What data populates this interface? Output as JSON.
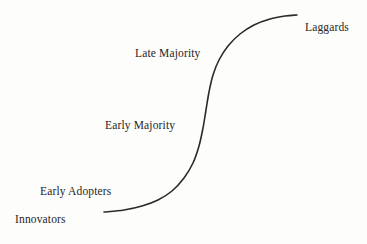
{
  "figure": {
    "name": "technology-adoption-s-curve",
    "background_color": "#fdfdfc",
    "curve_color": "#2b2b2b",
    "text_color": "#262626",
    "width": 367,
    "height": 244
  },
  "labels": {
    "innovators": "Innovators",
    "early_adopters": "Early Adopters",
    "early_majority": "Early Majority",
    "late_majority": "Late Majority",
    "laggards": "Laggards"
  },
  "chart_data": {
    "type": "line",
    "title": "",
    "xlabel": "",
    "ylabel": "",
    "grid": false,
    "legend": "none",
    "axis_visible": false,
    "xlim": [
      0,
      367
    ],
    "ylim": [
      244,
      0
    ],
    "series": [
      {
        "name": "Cumulative adoption S-curve",
        "color": "#2b2b2b",
        "line_width": 1.6,
        "points": [
          [
            104,
            212
          ],
          [
            124,
            210
          ],
          [
            142,
            206
          ],
          [
            158,
            200
          ],
          [
            172,
            191
          ],
          [
            184,
            178
          ],
          [
            193,
            163
          ],
          [
            199,
            146
          ],
          [
            203,
            128
          ],
          [
            206,
            110
          ],
          [
            209,
            92
          ],
          [
            213,
            75
          ],
          [
            219,
            60
          ],
          [
            228,
            46
          ],
          [
            240,
            34
          ],
          [
            254,
            25
          ],
          [
            270,
            19
          ],
          [
            285,
            16
          ],
          [
            297,
            15
          ]
        ]
      }
    ],
    "annotations": [
      {
        "text": "Innovators",
        "x": 15,
        "y": 219,
        "anchor": "left"
      },
      {
        "text": "Early Adopters",
        "x": 40,
        "y": 191,
        "anchor": "left"
      },
      {
        "text": "Early Majority",
        "x": 105,
        "y": 125,
        "anchor": "left"
      },
      {
        "text": "Late Majority",
        "x": 135,
        "y": 53,
        "anchor": "left"
      },
      {
        "text": "Laggards",
        "x": 305,
        "y": 27,
        "anchor": "left"
      }
    ]
  }
}
